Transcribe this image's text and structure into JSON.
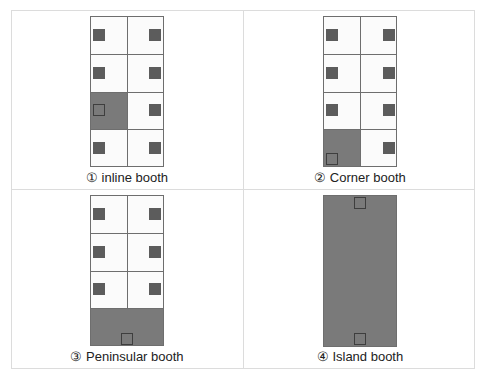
{
  "diagram": {
    "colors": {
      "booth_fill": "#fbfbfb",
      "occupied_fill": "#7a7a7a",
      "marker": "#5c5c5c",
      "border": "#6e6e6e",
      "frame": "#dcdcdc"
    },
    "panels": [
      {
        "id": 1,
        "label": "① inline booth",
        "type": "inline",
        "rows": 4,
        "cols": 2,
        "highlighted": "row 3, left cell"
      },
      {
        "id": 2,
        "label": "② Corner booth",
        "type": "corner",
        "rows": 4,
        "cols": 2,
        "highlighted": "row 4, left cell"
      },
      {
        "id": 3,
        "label": "③ Peninsular booth",
        "type": "peninsular",
        "rows": 4,
        "cols": 2,
        "highlighted": "row 4, full width"
      },
      {
        "id": 4,
        "label": "④ Island booth",
        "type": "island",
        "rows": 1,
        "cols": 1,
        "highlighted": "entire block"
      }
    ]
  }
}
